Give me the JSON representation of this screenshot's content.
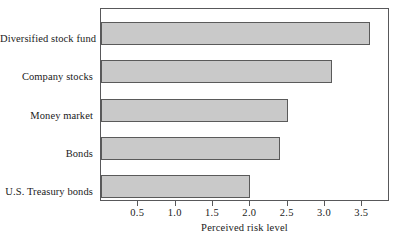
{
  "chart_data": {
    "type": "bar",
    "orientation": "horizontal",
    "title": "",
    "subtitle": "",
    "xlabel": "Perceived risk level",
    "ylabel": "",
    "categories": [
      "Diversified stock fund",
      "Company stocks",
      "Money market",
      "Bonds",
      "U.S. Treasury bonds"
    ],
    "values": [
      3.6,
      3.1,
      2.5,
      2.4,
      2.0
    ],
    "xlim": [
      0,
      3.87
    ],
    "ylim": [
      0,
      5
    ],
    "xticks": [
      0.5,
      1.0,
      1.5,
      2.0,
      2.5,
      3.0,
      3.5
    ],
    "xtick_labels": [
      "0.5",
      "1.0",
      "1.5",
      "2.0",
      "2.5",
      "3.0",
      "3.5"
    ],
    "grid": false,
    "legend": null,
    "bar_fill_color": "#c9c9c9",
    "bar_border_color": "#5a5a5a",
    "frame_color": "#58585a",
    "background_color": "#ffffff"
  }
}
